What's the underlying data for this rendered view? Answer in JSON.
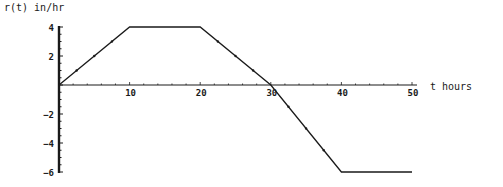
{
  "chart_data": {
    "type": "line",
    "title": "",
    "ylabel": "r(t) in/hr",
    "xlabel": "t hours",
    "xlim": [
      0,
      50
    ],
    "ylim": [
      -6,
      4
    ],
    "x_ticks": [
      10,
      20,
      30,
      40,
      50
    ],
    "x_tick_labels": [
      "10",
      "20",
      "30",
      "40",
      "50"
    ],
    "y_ticks": [
      4,
      2,
      -2,
      -4,
      -6
    ],
    "y_tick_labels": [
      "4",
      "2",
      "-2",
      "-4",
      "-6"
    ],
    "grid": false,
    "legend": null,
    "series": [
      {
        "name": "r(t)",
        "x": [
          0,
          10,
          20,
          30,
          40,
          50
        ],
        "y": [
          0,
          4,
          4,
          0,
          -6,
          -6
        ]
      }
    ]
  },
  "style": {
    "line_color": "#1a1a1a",
    "axis_color": "#1a1a1a",
    "background": "#ffffff"
  }
}
